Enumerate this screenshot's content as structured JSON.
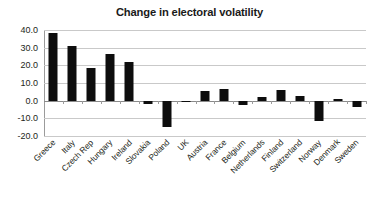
{
  "chart_data": {
    "type": "bar",
    "title": "Change in electoral volatility",
    "xlabel": "",
    "ylabel": "",
    "ylim": [
      -20.0,
      40.0
    ],
    "ytick_step": 10.0,
    "yticks": [
      40.0,
      30.0,
      20.0,
      10.0,
      0.0,
      -10.0,
      -20.0
    ],
    "ytick_labels": [
      "40.0",
      "30.0",
      "20.0",
      "10.0",
      "0.0",
      "-10.0",
      "-20.0"
    ],
    "grid": true,
    "legend": false,
    "legend_position": "none",
    "bar_color": "#0d0d0d",
    "categories": [
      "Greece",
      "Italy",
      "Czech Rep",
      "Hungary",
      "Ireland",
      "Slovakia",
      "Poland",
      "UK",
      "Austria",
      "France",
      "Belgium",
      "Netherlands",
      "Finland",
      "Switzerland",
      "Norway",
      "Denmark",
      "Sweden"
    ],
    "values": [
      38.5,
      31.2,
      18.3,
      26.3,
      21.8,
      -1.8,
      -15.0,
      -0.3,
      5.2,
      6.4,
      -2.5,
      2.3,
      6.3,
      2.4,
      -11.5,
      0.8,
      -3.8
    ]
  }
}
